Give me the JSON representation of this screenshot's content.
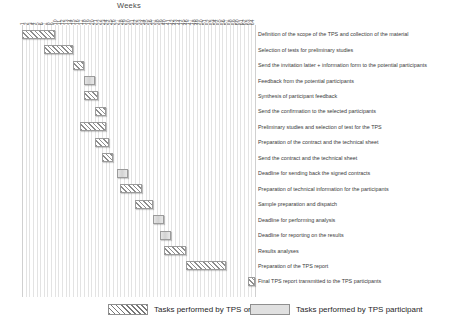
{
  "chart_data": {
    "type": "bar",
    "title": "Weeks",
    "xlabel": "Weeks",
    "ylabel": "",
    "xlim": [
      1,
      64
    ],
    "grid": true,
    "orientation": "horizontal-gantt",
    "tick_labels": [
      "1",
      "2",
      "3",
      "4",
      "5",
      "6",
      "7",
      "8",
      "9",
      "10",
      "11",
      "12",
      "13",
      "14",
      "15",
      "16",
      "17",
      "18",
      "19",
      "20",
      "21",
      "22",
      "23",
      "24",
      "25",
      "26",
      "27",
      "28",
      "29",
      "30",
      "31",
      "32",
      "33",
      "34",
      "35",
      "36",
      "37",
      "38",
      "39",
      "40",
      "41",
      "42",
      "43",
      "44",
      "45",
      "46",
      "47",
      "48",
      "49",
      "50",
      "51",
      "52",
      "53",
      "54",
      "55",
      "56",
      "57",
      "58",
      "59",
      "60",
      "61",
      "62",
      "63",
      "64"
    ],
    "legend_position": "bottom",
    "series": [
      {
        "name": "Tasks performed by TPS organiser",
        "key": "organiser",
        "pattern": "diagonal-hatch",
        "color": "#8d8d8d"
      },
      {
        "name": "Tasks performed by TPS participant",
        "key": "participant",
        "pattern": "solid",
        "color": "#d2d2d2"
      }
    ],
    "categories": [
      "Definition of the scope of the TPS and collection of the material",
      "Selection of tests for preliminary studies",
      "Send the invitation latter + information form to the potential participants",
      "Feedback from the potential participants",
      "Synthesis of participant feedback",
      "Send the confirmation to the selected participants",
      "Preliminary studies and selection of test for the TPS",
      "Preparation of the contract and the technical sheet",
      "Send the contract and the technical sheet",
      "Deadline for sending back the signed contracts",
      "Preparation of technical information for the participants",
      "Sample preparation and dispatch",
      "Deadline for performing analysis",
      "Deadline for reporting on the results",
      "Results analyses",
      "Preparation of the TPS report",
      "Final TPS report transmitted to the TPS participants"
    ],
    "tasks": [
      {
        "label": "Definition of the scope of the TPS and collection of the material",
        "start": 1,
        "end": 9,
        "series": "organiser"
      },
      {
        "label": "Selection of tests for preliminary studies",
        "start": 7,
        "end": 14,
        "series": "organiser"
      },
      {
        "label": "Send the invitation latter + information form to the potential participants",
        "start": 15,
        "end": 17,
        "series": "organiser"
      },
      {
        "label": "Feedback from the potential participants",
        "start": 18,
        "end": 20,
        "series": "participant"
      },
      {
        "label": "Synthesis of participant feedback",
        "start": 18,
        "end": 21,
        "series": "organiser"
      },
      {
        "label": "Send the confirmation to the selected participants",
        "start": 21,
        "end": 23,
        "series": "organiser"
      },
      {
        "label": "Preliminary studies and selection of test for the TPS",
        "start": 17,
        "end": 23,
        "series": "organiser"
      },
      {
        "label": "Preparation of the contract and the technical sheet",
        "start": 21,
        "end": 24,
        "series": "organiser"
      },
      {
        "label": "Send the contract and the technical sheet",
        "start": 23,
        "end": 25,
        "series": "organiser"
      },
      {
        "label": "Deadline for sending back the signed contracts",
        "start": 27,
        "end": 29,
        "series": "participant"
      },
      {
        "label": "Preparation of technical information for the participants",
        "start": 28,
        "end": 33,
        "series": "organiser"
      },
      {
        "label": "Sample preparation and dispatch",
        "start": 32,
        "end": 36,
        "series": "organiser"
      },
      {
        "label": "Deadline for performing analysis",
        "start": 37,
        "end": 39,
        "series": "participant"
      },
      {
        "label": "Deadline for reporting on the results",
        "start": 39,
        "end": 41,
        "series": "participant"
      },
      {
        "label": "Results analyses",
        "start": 40,
        "end": 45,
        "series": "organiser"
      },
      {
        "label": "Preparation of the TPS report",
        "start": 46,
        "end": 56,
        "series": "organiser"
      },
      {
        "label": "Final TPS report transmitted to the TPS participants",
        "start": 63,
        "end": 64,
        "series": "organiser"
      }
    ]
  },
  "legend": {
    "organiser_label": "Tasks performed by TPS organiser",
    "participant_label": "Tasks performed by TPS participant"
  }
}
